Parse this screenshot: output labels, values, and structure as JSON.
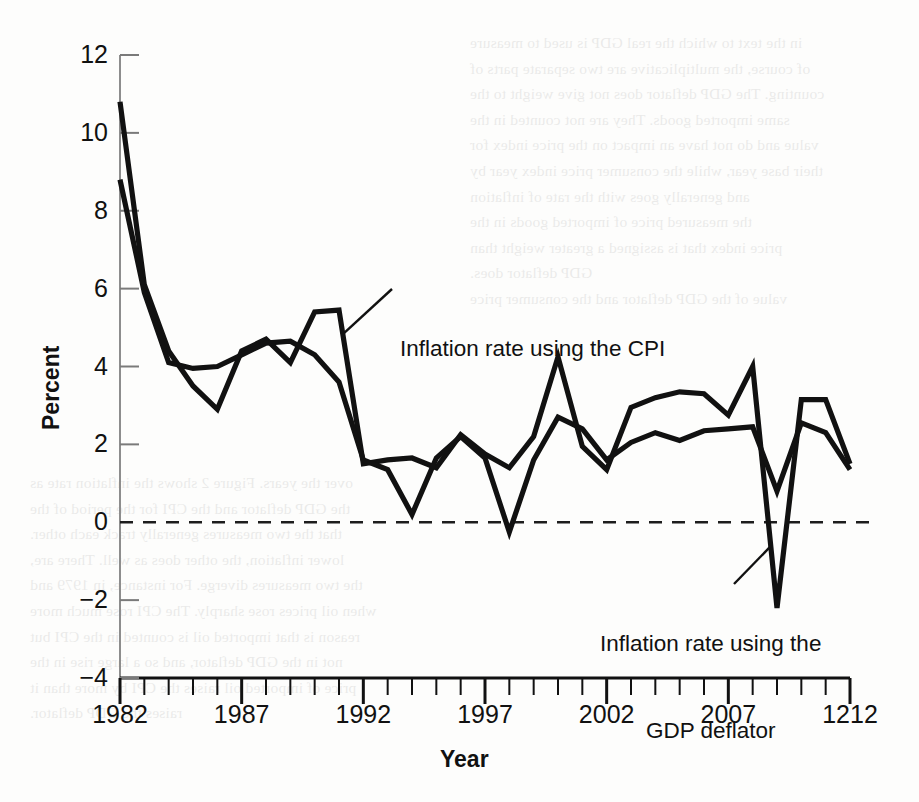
{
  "figure": {
    "background_color": "#fdfdfc",
    "ink_color": "#111111",
    "y_axis_title": "Percent",
    "x_axis_title": "Year"
  },
  "annotations": {
    "cpi": {
      "line1": "Inflation rate using the CPI"
    },
    "deflator": {
      "line1": "Inflation rate using the",
      "line2": "GDP deflator"
    }
  },
  "bleed_text": [
    "in the text to which the real GDP is used to measure",
    "of course, the multiplicative are two separate parts of",
    "counting. The GDP deflator does not give weight to the",
    "same imported goods. They are not counted in the",
    "value and do not have an impact on the price index for",
    "their base year, while the consumer price index year by",
    "and generally goes with the rate of inflation",
    "the measured price of imported goods in the",
    "price index that is assigned a greater weight than",
    "GDP deflator does.",
    "value of the GDP deflator and the consumer price",
    "over the years. Figure 2 shows the inflation rate as",
    "the GDP deflator and the CPI for the period of the",
    "that the two measures generally track each other.",
    "lower inflation, the other does as well. There are,",
    "the two measures diverge. For instance, in 1979 and",
    "when oil prices rose sharply. The CPI rose much more",
    "reason is that imported oil is counted in the CPI but",
    "not in the GDP deflator, and so a large rise in the",
    "price of imported oil raises the CPI by more than it",
    "raises the GDP deflator."
  ],
  "chart_data": {
    "type": "line",
    "title": "",
    "xlabel": "Year",
    "ylabel": "Percent",
    "xlim": [
      1982,
      2012
    ],
    "ylim": [
      -4,
      12
    ],
    "yticks": [
      12,
      10,
      8,
      6,
      4,
      2,
      0,
      -2,
      -4
    ],
    "ytick_labels": [
      "12",
      "10",
      "8",
      "6",
      "4",
      "2",
      "0",
      "−2",
      "−4"
    ],
    "xticks": [
      1982,
      1987,
      1992,
      1997,
      2002,
      2007,
      2012
    ],
    "xtick_labels": [
      "1982",
      "1987",
      "1992",
      "1997",
      "2002",
      "2007",
      "1212"
    ],
    "minor_xticks_every": 1,
    "grid": false,
    "zero_line": true,
    "zero_line_style": "dashed",
    "legend": "annotated-inline",
    "x": [
      1982,
      1983,
      1984,
      1985,
      1986,
      1987,
      1988,
      1989,
      1990,
      1991,
      1992,
      1993,
      1994,
      1995,
      1996,
      1997,
      1998,
      1999,
      2000,
      2001,
      2002,
      2003,
      2004,
      2005,
      2006,
      2007,
      2008,
      2009,
      2010,
      2011,
      2012
    ],
    "series": [
      {
        "name": "Inflation rate using the CPI",
        "values": [
          10.8,
          6.1,
          4.4,
          3.5,
          2.9,
          4.4,
          4.7,
          4.1,
          5.4,
          5.45,
          1.5,
          1.6,
          1.65,
          1.4,
          2.25,
          1.75,
          1.4,
          2.2,
          4.25,
          1.95,
          1.35,
          2.95,
          3.2,
          3.35,
          3.3,
          2.75,
          4.0,
          -2.2,
          3.15,
          3.15,
          1.5
        ]
      },
      {
        "name": "Inflation rate using the GDP deflator",
        "values": [
          8.8,
          5.9,
          4.1,
          3.95,
          4.0,
          4.3,
          4.6,
          4.65,
          4.3,
          3.6,
          1.6,
          1.35,
          0.2,
          1.65,
          2.2,
          1.65,
          -0.25,
          1.6,
          2.7,
          2.4,
          1.6,
          2.05,
          2.3,
          2.1,
          2.35,
          2.4,
          2.45,
          0.8,
          2.55,
          2.3,
          1.35
        ]
      }
    ]
  },
  "geometry": {
    "plot_left": 120,
    "plot_right": 850,
    "y_top_px": 55,
    "y_top_value": 12,
    "y_bottom_px": 678,
    "y_bottom_value": -4,
    "x_left_value": 1982,
    "x_right_value": 2012
  }
}
